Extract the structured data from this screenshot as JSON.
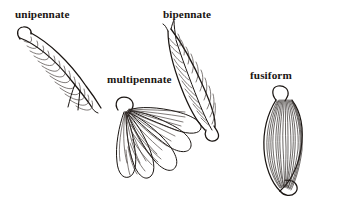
{
  "figure": {
    "background_color": "#ffffff",
    "ink_color": "#1a1512",
    "fiber_color": "#3a3330",
    "width": 339,
    "height": 205,
    "labels": [
      {
        "id": "unipennate",
        "text": "unipennate",
        "x": 15,
        "y": 8
      },
      {
        "id": "bipennate",
        "text": "bipennate",
        "x": 163,
        "y": 8
      },
      {
        "id": "multipennate",
        "text": "multipennate",
        "x": 107,
        "y": 73
      },
      {
        "id": "fusiform",
        "text": "fusiform",
        "x": 250,
        "y": 69
      }
    ],
    "diagrams": [
      {
        "id": "unipennate",
        "description": "curved band with oblique fibers inserting on one side of a tendon",
        "tendon_count": 1,
        "fiber_count": 13
      },
      {
        "id": "bipennate",
        "description": "central tendon with fibers angled in from two sides",
        "tendon_count": 1,
        "fiber_count": 16
      },
      {
        "id": "multipennate",
        "description": "several fiber lobes converging on a common tendon origin",
        "tendon_count": 1,
        "lobe_count": 5,
        "fiber_count": 22
      },
      {
        "id": "fusiform",
        "description": "spindle shaped belly with tendons at both ends and parallel fibers",
        "tendon_count": 2,
        "fiber_count": 17
      }
    ]
  }
}
